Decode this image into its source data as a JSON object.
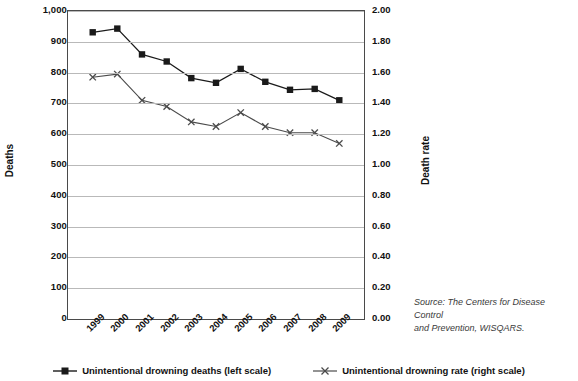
{
  "chart_data": {
    "type": "line",
    "title": "",
    "subtitle": "",
    "xlabel": "",
    "ylabel": "Deaths",
    "y2label": "Death rate",
    "categories": [
      "1999",
      "2000",
      "2001",
      "2002",
      "2003",
      "2004",
      "2005",
      "2006",
      "2007",
      "2008",
      "2009"
    ],
    "ylim": [
      0,
      1000
    ],
    "y2lim": [
      0.0,
      2.0
    ],
    "yticks": [
      "0",
      "100",
      "200",
      "300",
      "400",
      "500",
      "600",
      "700",
      "800",
      "900",
      "1,000"
    ],
    "y2ticks": [
      "0.00",
      "0.20",
      "0.40",
      "0.60",
      "0.80",
      "1.00",
      "1.20",
      "1.40",
      "1.60",
      "1.80",
      "2.00"
    ],
    "grid": true,
    "legend_position": "bottom",
    "series": [
      {
        "name": "Unintentional drowning deaths (left scale)",
        "axis": "left",
        "marker": "square",
        "color": "#1a1a1a",
        "values": [
          931,
          943,
          859,
          836,
          782,
          767,
          812,
          770,
          744,
          747,
          710
        ]
      },
      {
        "name": "Unintentional drowning rate (right scale)",
        "axis": "right",
        "marker": "x",
        "color": "#4a4a4a",
        "values": [
          1.57,
          1.59,
          1.42,
          1.38,
          1.28,
          1.25,
          1.34,
          1.25,
          1.21,
          1.21,
          1.14
        ]
      }
    ],
    "annotations": {
      "source": "Source: The Centers for Disease Control and Prevention, WISQARS."
    }
  },
  "axes": {
    "left_title": "Deaths",
    "right_title": "Death rate"
  },
  "source": {
    "line1": "Source: The Centers for Disease Control",
    "line2": "and Prevention, WISQARS."
  },
  "legend": {
    "items": [
      {
        "label": "Unintentional drowning deaths (left scale)",
        "marker": "square-marker"
      },
      {
        "label": "Unintentional drowning rate (right scale)",
        "marker": "x-marker"
      }
    ]
  }
}
